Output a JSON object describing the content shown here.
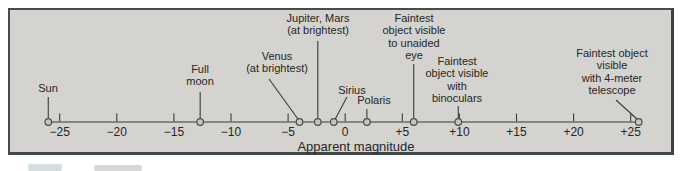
{
  "colors": {
    "page_background": "#ffffff",
    "box_fill": "#d4d3d0",
    "box_border": "#4b4a48",
    "line_color": "#3c3b3a",
    "text_color": "#262625",
    "marker_fill": "#c6c5c2",
    "marker_stroke": "#4e4d4b"
  },
  "chart_data": {
    "type": "number_line",
    "title": "",
    "xlabel": "Apparent magnitude",
    "axis": {
      "x_min": -27,
      "x_max": 27,
      "tick_step": 5,
      "x0_px": 345.2,
      "px_per_unit": 11.42,
      "axis_y_px": 122,
      "tick_height_px": 8.5,
      "grid": false
    },
    "ticks": [
      {
        "value": -25,
        "label": "−25"
      },
      {
        "value": -20,
        "label": "−20"
      },
      {
        "value": -15,
        "label": "−15"
      },
      {
        "value": -10,
        "label": "−10"
      },
      {
        "value": -5,
        "label": "−5"
      },
      {
        "value": 0,
        "label": "0"
      },
      {
        "value": 5,
        "label": "+5"
      },
      {
        "value": 10,
        "label": "+10"
      },
      {
        "value": 15,
        "label": "+15"
      },
      {
        "value": 20,
        "label": "+20"
      },
      {
        "value": 25,
        "label": "+25"
      }
    ],
    "points": [
      {
        "name": "sun",
        "label": "Sun",
        "value": -26,
        "pointer": "vertical",
        "label_cx": 48,
        "label_top": 82,
        "pointer_start_y": 97
      },
      {
        "name": "full-moon",
        "label": "Full\nmoon",
        "value": -12.7,
        "pointer": "vertical",
        "label_cx": 200,
        "label_top": 63,
        "pointer_start_y": 92
      },
      {
        "name": "venus",
        "label": "Venus\n(at brightest)",
        "value": -4,
        "pointer": "diagonal",
        "label_cx": 277,
        "label_top": 50,
        "pointer_start": [
          269,
          79
        ]
      },
      {
        "name": "jupiter-mars",
        "label": "Jupiter, Mars\n(at brightest)",
        "value": -2.4,
        "pointer": "vertical",
        "label_cx": 318,
        "label_top": 12,
        "pointer_start_y": 41
      },
      {
        "name": "sirius",
        "label": "Sirius",
        "value": -1,
        "pointer": "diagonal",
        "label_cx": 352,
        "label_top": 84,
        "pointer_start": [
          347,
          97
        ]
      },
      {
        "name": "polaris",
        "label": "Polaris",
        "value": 1.9,
        "pointer": "vertical",
        "label_cx": 374,
        "label_top": 94,
        "pointer_start_y": 109
      },
      {
        "name": "unaided-eye",
        "label": "Faintest\nobject visible\nto unaided\neye",
        "value": 6,
        "pointer": "vertical",
        "label_cx": 414,
        "label_top": 12,
        "pointer_start_y": 64
      },
      {
        "name": "binoculars",
        "label": "Faintest\nobject visible\nwith\nbinoculars",
        "value": 9.9,
        "pointer": "vertical",
        "label_cx": 457,
        "label_top": 55,
        "pointer_start_y": 106
      },
      {
        "name": "telescope",
        "label": "Faintest object\nvisible\nwith 4-meter\ntelescope",
        "value": 25.7,
        "pointer": "diagonal",
        "label_cx": 612,
        "label_top": 47,
        "pointer_start": [
          616,
          100
        ]
      }
    ]
  }
}
